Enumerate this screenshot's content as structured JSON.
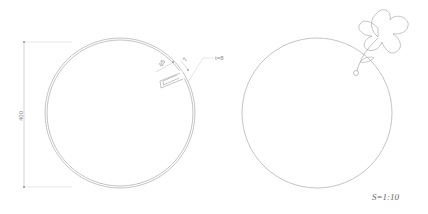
{
  "drawing": {
    "left_view": {
      "overall_dimension": "400",
      "slot_depth_dimension": "65",
      "slot_width_dimension": "7",
      "thickness_callout": "t=8"
    },
    "right_view": {
      "decoration": "flower with stem and leaf"
    },
    "scale_label": "S=1:10",
    "colors": {
      "line": "#999999",
      "background": "#ffffff"
    }
  }
}
